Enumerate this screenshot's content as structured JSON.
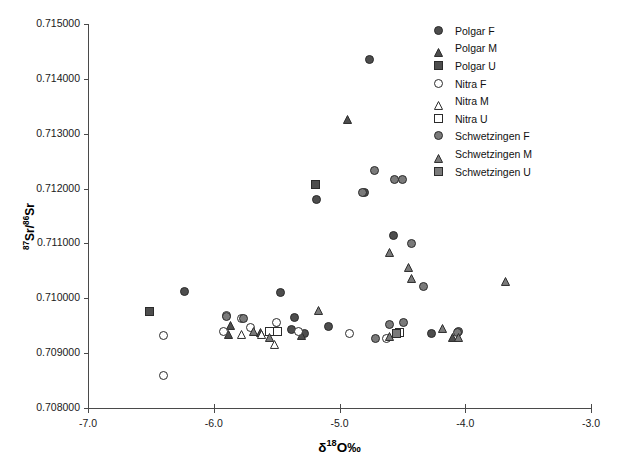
{
  "chart_data": {
    "type": "scatter",
    "title": "",
    "xlabel": "δ¹18O‰",
    "xlabel_parts": {
      "delta": "δ",
      "sup": "18",
      "rest": "O‰"
    },
    "ylabel_parts": {
      "sup1": "87",
      "mid": "Sr/",
      "sup2": "86",
      "rest": "Sr"
    },
    "xlim": [
      -7.0,
      -3.0
    ],
    "ylim": [
      0.708,
      0.715
    ],
    "xticks": [
      "-7.0",
      "-6.0",
      "-5.0",
      "-4.0",
      "-3.0"
    ],
    "xtick_values": [
      -7.0,
      -6.0,
      -5.0,
      -4.0,
      -3.0
    ],
    "yticks": [
      "0.708000",
      "0.709000",
      "0.710000",
      "0.711000",
      "0.712000",
      "0.713000",
      "0.714000",
      "0.715000"
    ],
    "ytick_values": [
      0.708,
      0.709,
      0.71,
      0.711,
      0.712,
      0.713,
      0.714,
      0.715
    ],
    "grid": false,
    "legend_position": "top-right",
    "colors": {
      "polgar": "#4d4d4d",
      "nitra": "#ffffff",
      "schwetzingen": "#7a7a7a",
      "edge": "#2b2b2b",
      "axis": "#4a4a4a",
      "text": "#111111"
    },
    "series": [
      {
        "name": "Polgar F",
        "marker": "circle",
        "fill": "#4d4d4d",
        "points": [
          [
            -4.76,
            0.71435
          ],
          [
            -4.57,
            0.71115
          ],
          [
            -5.18,
            0.7118
          ],
          [
            -4.8,
            0.71193
          ],
          [
            -6.23,
            0.71013
          ],
          [
            -5.47,
            0.7101
          ],
          [
            -5.36,
            0.70965
          ],
          [
            -5.38,
            0.70943
          ],
          [
            -5.28,
            0.70936
          ],
          [
            -5.09,
            0.70948
          ],
          [
            -4.27,
            0.70936
          ]
        ]
      },
      {
        "name": "Polgar M",
        "marker": "triangle",
        "fill": "#4d4d4d",
        "points": [
          [
            -4.94,
            0.71335
          ],
          [
            -5.87,
            0.70959
          ],
          [
            -5.88,
            0.70943
          ],
          [
            -5.63,
            0.70946
          ],
          [
            -5.3,
            0.70942
          ],
          [
            -4.1,
            0.70938
          ]
        ]
      },
      {
        "name": "Polgar U",
        "marker": "square",
        "fill": "#4d4d4d",
        "points": [
          [
            -5.19,
            0.71208
          ],
          [
            -6.51,
            0.70976
          ]
        ]
      },
      {
        "name": "Nitra F",
        "marker": "circle",
        "fill": "#ffffff",
        "points": [
          [
            -6.4,
            0.7086
          ],
          [
            -6.4,
            0.70933
          ],
          [
            -5.9,
            0.70968
          ],
          [
            -5.92,
            0.7094
          ],
          [
            -5.78,
            0.70964
          ],
          [
            -5.71,
            0.70947
          ],
          [
            -5.5,
            0.70956
          ],
          [
            -5.5,
            0.70941
          ],
          [
            -5.33,
            0.7094
          ],
          [
            -4.92,
            0.70936
          ],
          [
            -4.63,
            0.70927
          ]
        ]
      },
      {
        "name": "Nitra M",
        "marker": "triangle",
        "fill": "#ffffff",
        "points": [
          [
            -5.78,
            0.70944
          ],
          [
            -5.62,
            0.70943
          ],
          [
            -5.52,
            0.70925
          ]
        ]
      },
      {
        "name": "Nitra U",
        "marker": "square",
        "fill": "#ffffff",
        "points": [
          [
            -5.56,
            0.70939
          ],
          [
            -5.49,
            0.70939
          ],
          [
            -4.52,
            0.70937
          ]
        ]
      },
      {
        "name": "Schwetzingen F",
        "marker": "circle",
        "fill": "#7a7a7a",
        "points": [
          [
            -4.72,
            0.71233
          ],
          [
            -4.56,
            0.71217
          ],
          [
            -4.5,
            0.71216
          ],
          [
            -4.82,
            0.71193
          ],
          [
            -4.33,
            0.71022
          ],
          [
            -4.43,
            0.711
          ],
          [
            -5.9,
            0.70966
          ],
          [
            -5.76,
            0.70964
          ],
          [
            -4.6,
            0.70953
          ],
          [
            -4.49,
            0.70955
          ],
          [
            -4.05,
            0.70939
          ],
          [
            -4.06,
            0.70938
          ],
          [
            -4.71,
            0.70926
          ]
        ]
      },
      {
        "name": "Schwetzingen M",
        "marker": "triangle",
        "fill": "#7a7a7a",
        "points": [
          [
            -4.6,
            0.71092
          ],
          [
            -4.45,
            0.71065
          ],
          [
            -4.43,
            0.71045
          ],
          [
            -3.68,
            0.7104
          ],
          [
            -5.17,
            0.70986
          ],
          [
            -4.18,
            0.70954
          ],
          [
            -5.68,
            0.70948
          ],
          [
            -5.56,
            0.70938
          ],
          [
            -4.05,
            0.70938
          ],
          [
            -4.6,
            0.7094
          ]
        ]
      },
      {
        "name": "Schwetzingen U",
        "marker": "square",
        "fill": "#7a7a7a",
        "points": [
          [
            -4.55,
            0.70936
          ]
        ]
      }
    ]
  },
  "legend": {
    "entries": [
      {
        "label": "Polgar F",
        "marker": "circle",
        "fill": "#4d4d4d"
      },
      {
        "label": "Polgar M",
        "marker": "triangle",
        "fill": "#4d4d4d"
      },
      {
        "label": "Polgar U",
        "marker": "square",
        "fill": "#4d4d4d"
      },
      {
        "label": "Nitra F",
        "marker": "circle",
        "fill": "#ffffff"
      },
      {
        "label": "Nitra M",
        "marker": "triangle",
        "fill": "#ffffff"
      },
      {
        "label": "Nitra U",
        "marker": "square",
        "fill": "#ffffff"
      },
      {
        "label": "Schwetzingen F",
        "marker": "circle",
        "fill": "#7a7a7a"
      },
      {
        "label": "Schwetzingen M",
        "marker": "triangle",
        "fill": "#7a7a7a"
      },
      {
        "label": "Schwetzingen U",
        "marker": "square",
        "fill": "#7a7a7a"
      }
    ]
  },
  "plot_box": {
    "left": 88,
    "right": 591,
    "top": 24,
    "bottom": 408
  }
}
